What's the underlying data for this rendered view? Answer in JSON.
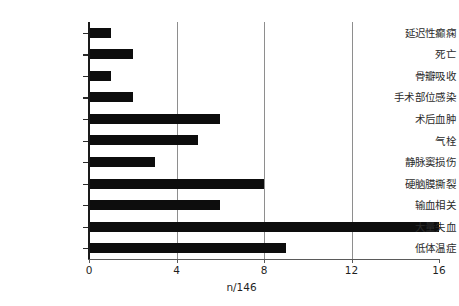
{
  "chart_data": {
    "type": "bar",
    "orientation": "horizontal",
    "title": "",
    "subtitle": "",
    "xlabel": "n/146",
    "ylabel": "",
    "categories": [
      "延迟性癫痫",
      "死亡",
      "骨瓣吸收",
      "手术部位感染",
      "术后血肿",
      "气栓",
      "静脉窦损伤",
      "硬脑膜撕裂",
      "输血相关",
      "大量失血",
      "低体温症"
    ],
    "values": [
      1,
      2,
      1,
      2,
      6,
      5,
      3,
      8,
      6,
      16,
      9
    ],
    "xlim": [
      0,
      16
    ],
    "xticks": [
      0,
      4,
      8,
      12,
      16
    ],
    "xtick_labels": [
      "0",
      "4",
      "8",
      "12",
      "16"
    ],
    "gridlines_x": [
      4,
      8,
      12
    ],
    "grid": true,
    "legend": "none",
    "bar_color": "#0d0d0d",
    "grid_color": "#8e8e8e",
    "axis_color": "#1a1a1a",
    "background": "#ffffff"
  }
}
